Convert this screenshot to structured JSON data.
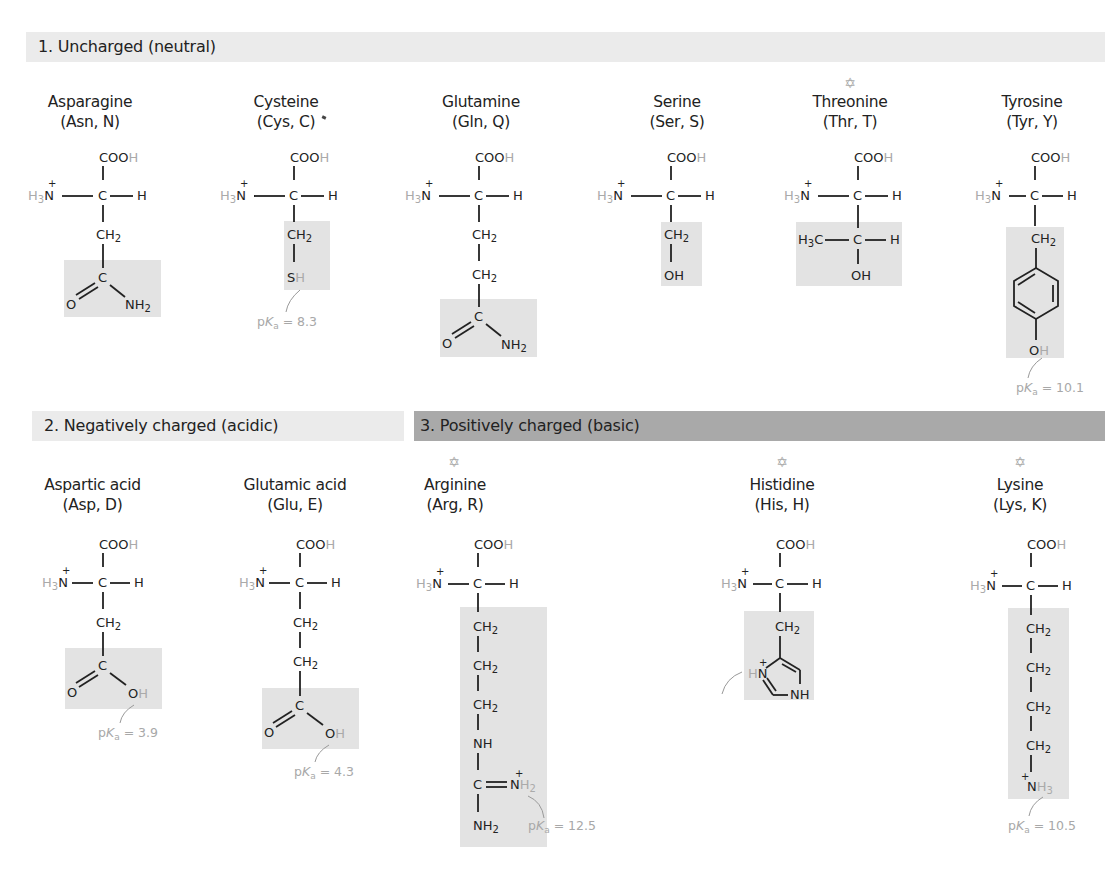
{
  "sections": [
    {
      "id": "uncharged",
      "title": "1. Uncharged (neutral)"
    },
    {
      "id": "negative",
      "title": "2. Negatively charged (acidic)"
    },
    {
      "id": "positive",
      "title": "3. Positively charged (basic)"
    }
  ],
  "backbone": {
    "carboxyl": "COO",
    "acid_h": "H",
    "amine_h": "H",
    "amine_sub": "3",
    "amine_n": "N",
    "plus": "+",
    "alpha_c": "C",
    "alpha_h": "H"
  },
  "amino_acids": [
    {
      "name": "Asparagine",
      "abbr": "(Asn, N)",
      "section": "uncharged",
      "essential": false
    },
    {
      "name": "Cysteine",
      "abbr": "(Cys, C)",
      "section": "uncharged",
      "essential": false,
      "pka": "8.3"
    },
    {
      "name": "Glutamine",
      "abbr": "(Gln, Q)",
      "section": "uncharged",
      "essential": false
    },
    {
      "name": "Serine",
      "abbr": "(Ser, S)",
      "section": "uncharged",
      "essential": false
    },
    {
      "name": "Threonine",
      "abbr": "(Thr, T)",
      "section": "uncharged",
      "essential": true
    },
    {
      "name": "Tyrosine",
      "abbr": "(Tyr, Y)",
      "section": "uncharged",
      "essential": false,
      "pka": "10.1"
    },
    {
      "name": "Aspartic acid",
      "abbr": "(Asp, D)",
      "section": "negative",
      "essential": false,
      "pka": "3.9"
    },
    {
      "name": "Glutamic acid",
      "abbr": "(Glu, E)",
      "section": "negative",
      "essential": false,
      "pka": "4.3"
    },
    {
      "name": "Arginine",
      "abbr": "(Arg, R)",
      "section": "positive",
      "essential": true,
      "pka": "12.5"
    },
    {
      "name": "Histidine",
      "abbr": "(His, H)",
      "section": "positive",
      "essential": true,
      "pka": "6.0"
    },
    {
      "name": "Lysine",
      "abbr": "(Lys, K)",
      "section": "positive",
      "essential": true,
      "pka": "10.5"
    }
  ],
  "labels": {
    "pka_prefix": "p",
    "pka_k": "K",
    "pka_a": "a",
    "pka_eq": " = ",
    "ch2": "CH",
    "two": "2",
    "sh_s": "S",
    "sh_h": "H",
    "oh": "OH",
    "o": "O",
    "oh_o": "O",
    "oh_h": "H",
    "nh2": "NH",
    "nh": "NH",
    "c": "C",
    "h": "H",
    "h3c": "H",
    "three": "3",
    "c_of_h3c": "C",
    "n": "N",
    "star": "✡"
  },
  "colors": {
    "header_light": "#ebebeb",
    "header_dark": "#a9a9a9",
    "shade": "#e3e3e3",
    "grey_text": "#aaaaaa"
  }
}
